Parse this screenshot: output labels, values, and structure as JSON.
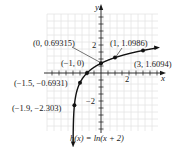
{
  "chart_data": {
    "type": "line",
    "title": "",
    "function_label": "h(x) = ln(x + 2)",
    "xlabel": "x",
    "ylabel": "y",
    "xlim": [
      -3.8,
      4.1
    ],
    "ylim": [
      -4.2,
      4.2
    ],
    "x_tick_labels": [
      {
        "value": 2,
        "label": "2"
      }
    ],
    "y_tick_labels": [
      {
        "value": 2,
        "label": "2"
      },
      {
        "value": -2,
        "label": "−2"
      }
    ],
    "tick_spacing": 0.5,
    "grid": true,
    "points": [
      {
        "x": -1.9,
        "y": -2.303,
        "label": "(−1.9, −2.303)"
      },
      {
        "x": -1.5,
        "y": -0.6931,
        "label": "(−1.5, −0.6931)"
      },
      {
        "x": -1,
        "y": 0,
        "label": "(−1, 0)"
      },
      {
        "x": 0,
        "y": 0.69315,
        "label": "(0, 0.69315)"
      },
      {
        "x": 1,
        "y": 1.0986,
        "label": "(1, 1.0986)"
      },
      {
        "x": 3,
        "y": 1.6094,
        "label": "(3, 1.6094)"
      }
    ],
    "asymptote": {
      "x": -2,
      "shown": false
    }
  },
  "colors": {
    "grid": "#e4e4e4",
    "axis": "#1a1a1a",
    "curve": "#111111",
    "text": "#1a1a1a"
  }
}
